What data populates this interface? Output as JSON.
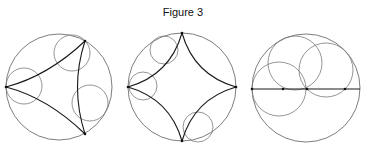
{
  "figure": {
    "title": "Figure 3",
    "colors": {
      "outer": "#6e6e6e",
      "inner": "#7a7a7a",
      "geodesic": "#1a1a1a",
      "point": "#111111"
    }
  },
  "panels": [
    {
      "name": "ideal-triangle",
      "outer_circle": {
        "cx": 59,
        "cy": 87,
        "r": 53
      },
      "inner_circles": [
        {
          "cx": 72,
          "cy": 53,
          "r": 18
        },
        {
          "cx": 24,
          "cy": 86,
          "r": 18
        },
        {
          "cx": 90,
          "cy": 103,
          "r": 18
        }
      ],
      "geodesics": [
        {
          "from": [
            6,
            87
          ],
          "ctrl": [
            48,
            76
          ],
          "to": [
            85,
            41
          ]
        },
        {
          "from": [
            6,
            87
          ],
          "ctrl": [
            48,
            98
          ],
          "to": [
            85,
            134
          ]
        },
        {
          "from": [
            85,
            41
          ],
          "ctrl": [
            70,
            87
          ],
          "to": [
            85,
            134
          ]
        }
      ],
      "points": [
        [
          6,
          87
        ],
        [
          85,
          41
        ],
        [
          85,
          134
        ]
      ]
    },
    {
      "name": "ideal-quadrilateral",
      "outer_circle": {
        "cx": 182,
        "cy": 87,
        "r": 54
      },
      "inner_circles": [
        {
          "cx": 164,
          "cy": 50,
          "r": 14
        },
        {
          "cx": 143,
          "cy": 86,
          "r": 14
        },
        {
          "cx": 198,
          "cy": 127,
          "r": 15
        }
      ],
      "geodesics": [
        {
          "from": [
            182,
            33
          ],
          "ctrl": [
            170,
            75
          ],
          "to": [
            128,
            87
          ]
        },
        {
          "from": [
            182,
            33
          ],
          "ctrl": [
            194,
            75
          ],
          "to": [
            236,
            87
          ]
        },
        {
          "from": [
            128,
            87
          ],
          "ctrl": [
            170,
            99
          ],
          "to": [
            182,
            141
          ]
        },
        {
          "from": [
            236,
            87
          ],
          "ctrl": [
            194,
            99
          ],
          "to": [
            182,
            141
          ]
        }
      ],
      "points": [
        [
          182,
          33
        ],
        [
          128,
          87
        ],
        [
          236,
          87
        ],
        [
          182,
          141
        ]
      ]
    },
    {
      "name": "horocycles-on-diameter",
      "outer_circle": {
        "cx": 306,
        "cy": 88,
        "r": 54
      },
      "inner_circles": [
        {
          "cx": 279,
          "cy": 89,
          "r": 27
        },
        {
          "cx": 295,
          "cy": 63,
          "r": 27
        },
        {
          "cx": 326,
          "cy": 70,
          "r": 27
        }
      ],
      "lines": [
        {
          "from": [
            252,
            89
          ],
          "to": [
            360,
            89
          ]
        }
      ],
      "points": [
        [
          252,
          89
        ],
        [
          283,
          89
        ],
        [
          307,
          89
        ],
        [
          345,
          89
        ]
      ]
    }
  ]
}
